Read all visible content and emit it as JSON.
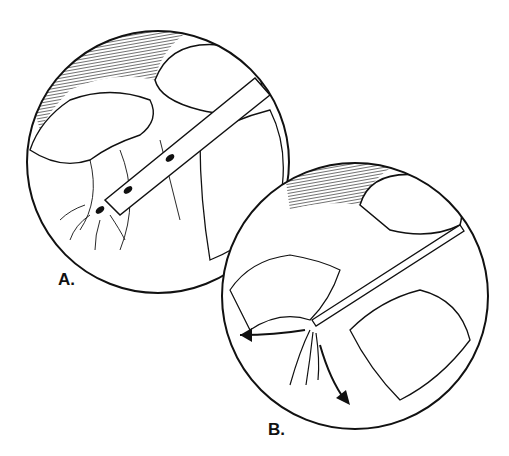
{
  "figure": {
    "panel_a": {
      "label": "A."
    },
    "panel_b": {
      "label": "B."
    }
  },
  "colors": {
    "ink": "#111111",
    "background": "#ffffff"
  }
}
